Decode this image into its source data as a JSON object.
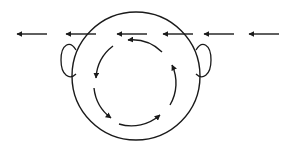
{
  "diagram": {
    "type": "head-top-view-airflow",
    "colors": {
      "stroke": "#1a1a1a",
      "background": "#ffffff"
    },
    "head": {
      "cx": 136,
      "cy": 76,
      "r": 64
    },
    "ears": [
      {
        "side": "left",
        "cx": 69,
        "cy": 61,
        "rx": 8,
        "ry": 17
      },
      {
        "side": "right",
        "cx": 204,
        "cy": 61,
        "rx": 8,
        "ry": 17
      }
    ],
    "flow_arrows": {
      "direction": "left",
      "y": 34,
      "arrows": [
        {
          "x_head": 14,
          "x_tail": 47
        },
        {
          "x_head": 63,
          "x_tail": 96
        },
        {
          "x_head": 114,
          "x_tail": 147
        },
        {
          "x_head": 160,
          "x_tail": 193
        },
        {
          "x_head": 201,
          "x_tail": 234
        },
        {
          "x_head": 246,
          "x_tail": 279
        }
      ]
    },
    "circulation": {
      "direction": "counter-clockwise",
      "cx": 136,
      "cy": 82,
      "r": 43,
      "segments": 4
    }
  }
}
